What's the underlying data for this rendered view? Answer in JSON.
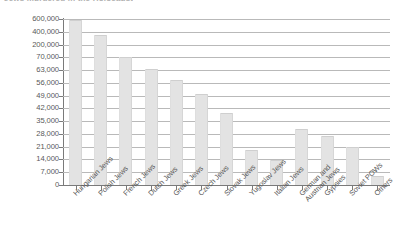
{
  "chart_data": {
    "type": "bar",
    "title": "Jews murdered in the Holocaust",
    "xlabel": "",
    "ylabel": "",
    "grid": true,
    "legend": "none",
    "axis_note": "broken / non-linear y-axis: 0 to 70,000 in 7,000 steps, then 200,000 / 400,000 / 600,000",
    "ylim": [
      0,
      600000
    ],
    "ytick_labels": [
      "600,000",
      "400,000",
      "200,000",
      "70,000",
      "63,000",
      "56,000",
      "49,000",
      "42,000",
      "35,000",
      "28,000",
      "21,000",
      "14,000",
      "7,000",
      "0"
    ],
    "ytick_values": [
      600000,
      400000,
      200000,
      70000,
      63000,
      56000,
      49000,
      42000,
      35000,
      28000,
      21000,
      14000,
      7000,
      0
    ],
    "categories": [
      "Hungarian Jews",
      "Polish Jews",
      "French Jews",
      "Dutch Jews",
      "Greek Jews",
      "Czech Jews",
      "Slovak Jews",
      "Yugoslav Jews",
      "Italian Jews",
      "German and\nAustrian Jews",
      "Gypsies",
      "Soviet POWs",
      "Others"
    ],
    "values": [
      400000,
      300000,
      70000,
      63000,
      56000,
      45000,
      28000,
      10500,
      7500,
      23000,
      20000,
      11500,
      2000
    ],
    "bar_tops_px": [
      165,
      150,
      128,
      116,
      105,
      91,
      72,
      35,
      25,
      56,
      49,
      38,
      9
    ],
    "bar_color": "#e3e3e3",
    "gridline_color": "#b9b9b9",
    "axis_color": "#7a7a7a",
    "text_color": "#585858"
  }
}
